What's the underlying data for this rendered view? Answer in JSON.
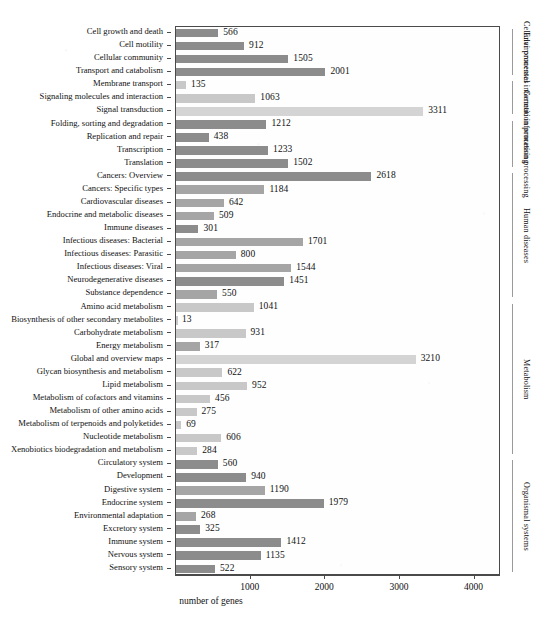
{
  "figure": {
    "xlabel": "number of genes",
    "caption": ""
  },
  "axis": {
    "xticks": [
      "1000",
      "2000",
      "3000",
      "4000"
    ],
    "xtick_values": [
      1000,
      2000,
      3000,
      4000
    ],
    "xmin": 0,
    "xmax": 4300
  },
  "groups": [
    {
      "label": "Cellular processes"
    },
    {
      "label": "Environmental information processing"
    },
    {
      "label": "Genetic information processing"
    },
    {
      "label": "Human diseases"
    },
    {
      "label": "Metabolism"
    },
    {
      "label": "Organismal systems"
    }
  ],
  "chart_data": {
    "type": "bar",
    "orientation": "horizontal",
    "title": "",
    "xlabel": "number of genes",
    "ylabel": "",
    "xlim": [
      0,
      4300
    ],
    "grid": false,
    "legend": "none",
    "categories": [
      "Cell growth and death",
      "Cell motility",
      "Cellular community",
      "Transport and catabolism",
      "Membrane transport",
      "Signaling molecules and interaction",
      "Signal transduction",
      "Folding, sorting and degradation",
      "Replication and repair",
      "Transcription",
      "Translation",
      "Cancers: Overview",
      "Cancers: Specific types",
      "Cardiovascular diseases",
      "Endocrine and metabolic diseases",
      "Immune diseases",
      "Infectious diseases: Bacterial",
      "Infectious diseases: Parasitic",
      "Infectious diseases: Viral",
      "Neurodegenerative diseases",
      "Substance dependence",
      "Amino acid metabolism",
      "Biosynthesis of other secondary metabolites",
      "Carbohydrate metabolism",
      "Energy metabolism",
      "Global and overview maps",
      "Glycan biosynthesis and metabolism",
      "Lipid metabolism",
      "Metabolism of cofactors and vitamins",
      "Metabolism of other amino acids",
      "Metabolism of terpenoids and polyketides",
      "Nucleotide metabolism",
      "Xenobiotics biodegradation and metabolism",
      "Circulatory system",
      "Development",
      "Digestive system",
      "Endocrine system",
      "Environmental adaptation",
      "Excretory system",
      "Immune system",
      "Nervous system",
      "Sensory system"
    ],
    "values": [
      566,
      912,
      1505,
      2001,
      135,
      1063,
      3311,
      1212,
      438,
      1233,
      1502,
      2618,
      1184,
      642,
      509,
      301,
      1701,
      800,
      1544,
      1451,
      550,
      1041,
      13,
      931,
      317,
      3210,
      622,
      952,
      456,
      275,
      69,
      606,
      284,
      560,
      940,
      1190,
      1979,
      268,
      325,
      1412,
      1135,
      522
    ],
    "group_of_category": [
      "Cellular processes",
      "Cellular processes",
      "Cellular processes",
      "Cellular processes",
      "Environmental information processing",
      "Environmental information processing",
      "Environmental information processing",
      "Genetic information processing",
      "Genetic information processing",
      "Genetic information processing",
      "Genetic information processing",
      "Human diseases",
      "Human diseases",
      "Human diseases",
      "Human diseases",
      "Human diseases",
      "Human diseases",
      "Human diseases",
      "Human diseases",
      "Human diseases",
      "Human diseases",
      "Metabolism",
      "Metabolism",
      "Metabolism",
      "Metabolism",
      "Metabolism",
      "Metabolism",
      "Metabolism",
      "Metabolism",
      "Metabolism",
      "Metabolism",
      "Metabolism",
      "Metabolism",
      "Organismal systems",
      "Organismal systems",
      "Organismal systems",
      "Organismal systems",
      "Organismal systems",
      "Organismal systems",
      "Organismal systems",
      "Organismal systems",
      "Organismal systems"
    ],
    "bar_shades": [
      "dark",
      "dark",
      "dark",
      "dark",
      "light",
      "light",
      "xlight",
      "dark",
      "dark",
      "dark",
      "dark",
      "dark",
      "mid",
      "mid",
      "mid",
      "dark",
      "mid",
      "mid",
      "mid",
      "dark",
      "mid",
      "light",
      "light",
      "light",
      "mid",
      "xlight",
      "light",
      "light",
      "light",
      "light",
      "light",
      "light",
      "light",
      "dark",
      "dark",
      "mid",
      "dark",
      "mid",
      "dark",
      "dark",
      "dark",
      "dark"
    ],
    "colors": {
      "dark": "#8c8c8c",
      "mid": "#a0a0a0",
      "light": "#bdbdbd",
      "xlight": "#d4d4d4",
      "frame": "#4a4a4a",
      "text": "#111111"
    }
  }
}
